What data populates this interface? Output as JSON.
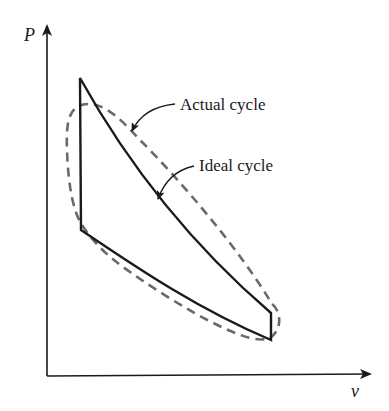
{
  "diagram": {
    "type": "P-v diagram",
    "axes": {
      "y_label": "P",
      "x_label": "v"
    },
    "curves": [
      {
        "name": "Ideal cycle",
        "style": "solid",
        "color": "#1a1a1a"
      },
      {
        "name": "Actual cycle",
        "style": "dashed",
        "color": "#6a6a6a"
      }
    ],
    "annotations": {
      "actual": "Actual cycle",
      "ideal": "Ideal cycle"
    }
  }
}
